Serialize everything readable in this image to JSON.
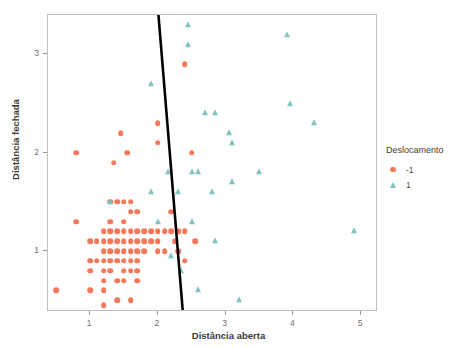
{
  "chart_data": {
    "type": "scatter",
    "title": "",
    "xlabel": "Distância aberta",
    "ylabel": "Distância fechada",
    "xlim": [
      0.38,
      5.25
    ],
    "ylim": [
      0.38,
      3.4
    ],
    "xticks": [
      1,
      2,
      3,
      4,
      5
    ],
    "yticks": [
      1,
      2,
      3
    ],
    "grid": false,
    "legend": {
      "title": "Deslocamento",
      "position": "right",
      "entries": [
        {
          "label": "-1",
          "marker": "circle",
          "color": "#F4795B"
        },
        {
          "label": "1",
          "marker": "triangle",
          "color": "#7FC6C0"
        }
      ]
    },
    "annotations": [
      {
        "name": "decision-boundary",
        "type": "line",
        "color": "#000000",
        "width": 2.6,
        "x0": 2.02,
        "y0": 3.4,
        "x1": 2.38,
        "y1": 0.38
      }
    ],
    "series": [
      {
        "name": "-1",
        "label": "-1",
        "marker": "circle",
        "color": "#F4795B",
        "points": [
          [
            0.5,
            0.6
          ],
          [
            0.8,
            2.0
          ],
          [
            0.8,
            1.3
          ],
          [
            1.0,
            1.1
          ],
          [
            1.0,
            0.9
          ],
          [
            1.0,
            0.8
          ],
          [
            1.0,
            0.6
          ],
          [
            1.1,
            1.1
          ],
          [
            1.1,
            0.9
          ],
          [
            1.2,
            1.2
          ],
          [
            1.2,
            1.1
          ],
          [
            1.2,
            1.0
          ],
          [
            1.2,
            0.9
          ],
          [
            1.2,
            0.8
          ],
          [
            1.2,
            0.7
          ],
          [
            1.2,
            0.6
          ],
          [
            1.2,
            0.45
          ],
          [
            1.3,
            1.5
          ],
          [
            1.3,
            1.3
          ],
          [
            1.3,
            1.2
          ],
          [
            1.3,
            1.1
          ],
          [
            1.3,
            1.0
          ],
          [
            1.3,
            0.9
          ],
          [
            1.3,
            0.8
          ],
          [
            1.35,
            1.9
          ],
          [
            1.4,
            1.5
          ],
          [
            1.4,
            1.2
          ],
          [
            1.4,
            1.1
          ],
          [
            1.4,
            1.0
          ],
          [
            1.4,
            0.9
          ],
          [
            1.4,
            0.7
          ],
          [
            1.4,
            0.5
          ],
          [
            1.45,
            2.2
          ],
          [
            1.5,
            1.5
          ],
          [
            1.5,
            1.3
          ],
          [
            1.5,
            1.2
          ],
          [
            1.5,
            1.1
          ],
          [
            1.5,
            1.0
          ],
          [
            1.5,
            0.9
          ],
          [
            1.5,
            0.8
          ],
          [
            1.5,
            0.7
          ],
          [
            1.55,
            2.0
          ],
          [
            1.6,
            1.5
          ],
          [
            1.6,
            1.4
          ],
          [
            1.6,
            1.2
          ],
          [
            1.6,
            1.1
          ],
          [
            1.6,
            1.0
          ],
          [
            1.6,
            0.9
          ],
          [
            1.6,
            0.8
          ],
          [
            1.6,
            0.5
          ],
          [
            1.7,
            1.4
          ],
          [
            1.7,
            1.2
          ],
          [
            1.7,
            1.1
          ],
          [
            1.7,
            1.0
          ],
          [
            1.7,
            0.9
          ],
          [
            1.7,
            0.8
          ],
          [
            1.7,
            0.7
          ],
          [
            1.8,
            1.2
          ],
          [
            1.8,
            1.1
          ],
          [
            1.8,
            1.0
          ],
          [
            1.9,
            1.2
          ],
          [
            1.9,
            1.1
          ],
          [
            2.0,
            2.3
          ],
          [
            2.0,
            2.1
          ],
          [
            2.0,
            1.2
          ],
          [
            2.0,
            1.1
          ],
          [
            2.0,
            1.0
          ],
          [
            2.1,
            1.2
          ],
          [
            2.1,
            1.0
          ],
          [
            2.2,
            1.4
          ],
          [
            2.2,
            1.2
          ],
          [
            2.25,
            1.1
          ],
          [
            2.3,
            1.2
          ],
          [
            2.3,
            1.0
          ],
          [
            2.4,
            2.9
          ],
          [
            2.4,
            1.2
          ],
          [
            2.4,
            0.9
          ],
          [
            2.5,
            2.0
          ],
          [
            2.55,
            1.1
          ]
        ]
      },
      {
        "name": "1",
        "label": "1",
        "marker": "triangle",
        "color": "#7FC6C0",
        "points": [
          [
            1.3,
            1.5
          ],
          [
            1.9,
            2.7
          ],
          [
            1.9,
            1.6
          ],
          [
            2.0,
            1.3
          ],
          [
            2.15,
            1.8
          ],
          [
            2.2,
            0.95
          ],
          [
            2.3,
            1.6
          ],
          [
            2.35,
            0.8
          ],
          [
            2.45,
            3.3
          ],
          [
            2.45,
            3.1
          ],
          [
            2.5,
            1.8
          ],
          [
            2.5,
            1.3
          ],
          [
            2.6,
            1.8
          ],
          [
            2.6,
            0.6
          ],
          [
            2.7,
            2.4
          ],
          [
            2.8,
            1.6
          ],
          [
            2.85,
            2.4
          ],
          [
            2.85,
            1.1
          ],
          [
            3.05,
            2.2
          ],
          [
            3.1,
            2.1
          ],
          [
            3.1,
            1.7
          ],
          [
            3.2,
            0.5
          ],
          [
            3.5,
            1.8
          ],
          [
            3.9,
            3.2
          ],
          [
            3.95,
            2.5
          ],
          [
            4.3,
            2.3
          ],
          [
            4.9,
            1.2
          ]
        ]
      }
    ]
  }
}
